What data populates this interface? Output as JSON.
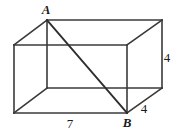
{
  "figure": {
    "type": "geometry-diagram",
    "shape_name": "rectangular-box",
    "background_color": "#ffffff",
    "edge_color": "#3a3a3a",
    "diagonal_color": "#2e2e2e",
    "label_color": "#1a1a1a",
    "canvas": {
      "width": 174,
      "height": 134
    },
    "vertices": {
      "back_top_left": {
        "x": 47,
        "y": 20
      },
      "back_top_right": {
        "x": 162,
        "y": 20
      },
      "back_bottom_right": {
        "x": 162,
        "y": 88
      },
      "back_bottom_left": {
        "x": 47,
        "y": 88
      },
      "front_top_left": {
        "x": 14,
        "y": 45
      },
      "front_top_right": {
        "x": 127,
        "y": 45
      },
      "front_bottom_right": {
        "x": 127,
        "y": 113
      },
      "front_bottom_left": {
        "x": 14,
        "y": 113
      }
    },
    "labels": {
      "point_a": {
        "text": "A",
        "x": 46,
        "y": 14
      },
      "point_b": {
        "text": "B",
        "x": 127,
        "y": 127
      },
      "length_bottom": {
        "text": "7",
        "x": 70,
        "y": 128
      },
      "length_right": {
        "text": "4",
        "x": 167,
        "y": 62
      },
      "length_depth": {
        "text": "4",
        "x": 144,
        "y": 113
      }
    },
    "diagonal": {
      "from": "A",
      "to": "B",
      "x1": 47,
      "y1": 20,
      "x2": 127,
      "y2": 113
    }
  }
}
